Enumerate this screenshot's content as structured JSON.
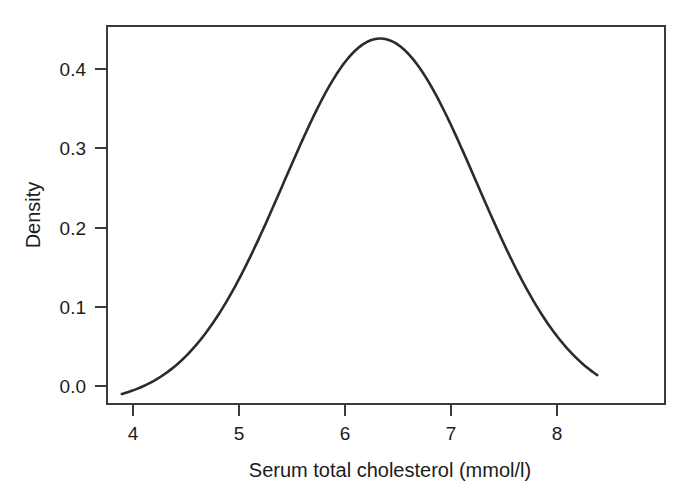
{
  "chart_data": {
    "type": "line",
    "title": "",
    "subtitle": "",
    "xlabel": "Serum total cholesterol (mmol/l)",
    "ylabel": "Density",
    "xlim": [
      3.72,
      8.99
    ],
    "ylim": [
      0.0,
      0.452
    ],
    "grid": false,
    "legend": null,
    "xticks": [
      4,
      5,
      6,
      7,
      8
    ],
    "xtick_labels": [
      "4",
      "5",
      "6",
      "7",
      "8"
    ],
    "yticks": [
      0.0,
      0.1,
      0.2,
      0.3,
      0.4
    ],
    "ytick_labels": [
      "0.0",
      "0.1",
      "0.2",
      "0.3",
      "0.4"
    ],
    "series": [
      {
        "name": "Density",
        "distribution": "normal-kernel-density",
        "peak_x": 6.3,
        "peak_y": 0.437,
        "mean": 6.3,
        "sd": 0.91,
        "x": [
          3.86,
          4.0,
          4.2,
          4.4,
          4.6,
          4.8,
          5.0,
          5.2,
          5.4,
          5.6,
          5.8,
          6.0,
          6.1,
          6.2,
          6.3,
          6.4,
          6.5,
          6.6,
          6.8,
          7.0,
          7.2,
          7.4,
          7.6,
          7.8,
          8.0,
          8.2,
          8.35
        ],
        "y": [
          0.017,
          0.022,
          0.031,
          0.044,
          0.061,
          0.083,
          0.11,
          0.143,
          0.181,
          0.224,
          0.27,
          0.334,
          0.371,
          0.406,
          0.433,
          0.436,
          0.425,
          0.404,
          0.355,
          0.299,
          0.241,
          0.186,
          0.138,
          0.097,
          0.065,
          0.042,
          0.025
        ]
      }
    ]
  },
  "axes": {
    "x_title": "Serum total cholesterol (mmol/l)",
    "y_title": "Density"
  }
}
